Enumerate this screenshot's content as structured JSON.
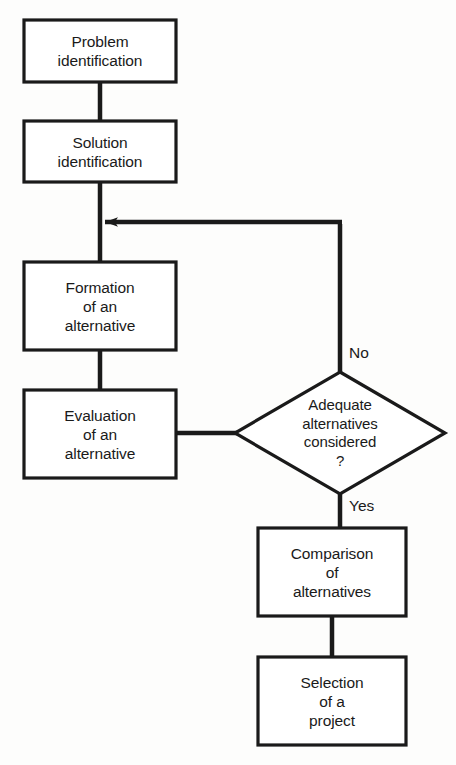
{
  "diagram": {
    "type": "flowchart",
    "orientation": "top-to-bottom with feedback loop",
    "nodes": [
      {
        "id": "problem-identification",
        "shape": "rectangle",
        "lines": [
          "Problem",
          "identification"
        ],
        "x": 24,
        "y": 20,
        "w": 152,
        "h": 62
      },
      {
        "id": "solution-identification",
        "shape": "rectangle",
        "lines": [
          "Solution",
          "identification"
        ],
        "x": 24,
        "y": 121,
        "w": 152,
        "h": 61
      },
      {
        "id": "formation-of-an-alternative",
        "shape": "rectangle",
        "lines": [
          "Formation",
          "of an",
          "alternative"
        ],
        "x": 24,
        "y": 262,
        "w": 152,
        "h": 88
      },
      {
        "id": "evaluation-of-an-alternative",
        "shape": "rectangle",
        "lines": [
          "Evaluation",
          "of an",
          "alternative"
        ],
        "x": 24,
        "y": 390,
        "w": 152,
        "h": 88
      },
      {
        "id": "adequate-alternatives-considered",
        "shape": "diamond",
        "lines": [
          "Adequate",
          "alternatives",
          "considered",
          "?"
        ],
        "cx": 340,
        "cy": 433,
        "rx": 105,
        "ry": 61
      },
      {
        "id": "comparison-of-alternatives",
        "shape": "rectangle",
        "lines": [
          "Comparison",
          "of",
          "alternatives"
        ],
        "x": 258,
        "y": 528,
        "w": 148,
        "h": 88
      },
      {
        "id": "selection-of-a-project",
        "shape": "rectangle",
        "lines": [
          "Selection",
          "of a",
          "project"
        ],
        "x": 258,
        "y": 657,
        "w": 148,
        "h": 88
      }
    ],
    "edges": [
      {
        "id": "problem-to-solution",
        "from": "problem-identification",
        "to": "solution-identification",
        "label": ""
      },
      {
        "id": "solution-to-formation",
        "from": "solution-identification",
        "to": "formation-of-an-alternative",
        "label": ""
      },
      {
        "id": "formation-to-evaluation",
        "from": "formation-of-an-alternative",
        "to": "evaluation-of-an-alternative",
        "label": ""
      },
      {
        "id": "evaluation-to-decision",
        "from": "evaluation-of-an-alternative",
        "to": "adequate-alternatives-considered",
        "label": ""
      },
      {
        "id": "decision-no-feedback",
        "from": "adequate-alternatives-considered",
        "to": "formation-of-an-alternative",
        "label": "No",
        "arrowhead": true
      },
      {
        "id": "decision-yes-to-comparison",
        "from": "adequate-alternatives-considered",
        "to": "comparison-of-alternatives",
        "label": "Yes"
      },
      {
        "id": "comparison-to-selection",
        "from": "comparison-of-alternatives",
        "to": "selection-of-a-project",
        "label": ""
      }
    ],
    "edge_labels": {
      "no": "No",
      "yes": "Yes"
    },
    "colors": {
      "background": "#fdfdfc",
      "stroke": "#1a1a1a",
      "node_fill": "#ffffff",
      "text": "#1a1a1a"
    }
  }
}
